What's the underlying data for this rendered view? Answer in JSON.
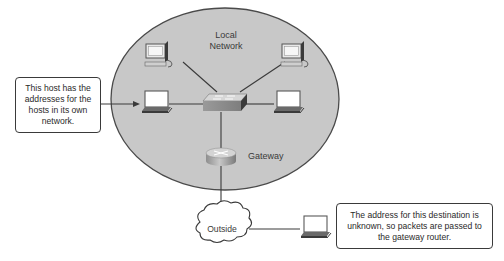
{
  "diagram": {
    "network_label_line1": "Local",
    "network_label_line2": "Network",
    "gateway_label": "Gateway",
    "outside_label": "Outside",
    "left_callout": "This host has the addresses for the hosts in its own network.",
    "right_callout": "The address for this destination is unknown, so packets are passed to the gateway router.",
    "nodes": [
      {
        "id": "pc-top-left",
        "type": "desktop-pc"
      },
      {
        "id": "pc-top-right",
        "type": "desktop-pc"
      },
      {
        "id": "laptop-left",
        "type": "laptop"
      },
      {
        "id": "laptop-right",
        "type": "laptop"
      },
      {
        "id": "switch",
        "type": "switch"
      },
      {
        "id": "gateway-router",
        "type": "router"
      },
      {
        "id": "outside-cloud",
        "type": "cloud"
      },
      {
        "id": "remote-laptop",
        "type": "laptop"
      }
    ],
    "colors": {
      "network_fill": "#c8c8c8",
      "network_stroke": "#4a4a4a",
      "line": "#3a3a3a",
      "box_border": "#3a3a3a"
    }
  }
}
